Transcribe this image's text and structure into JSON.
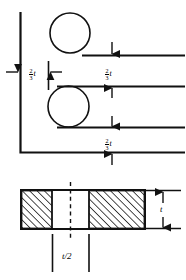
{
  "figure": {
    "stroke_color": "#1a1a1a",
    "background_color": "#ffffff"
  },
  "upper_view": {
    "name": "elevation-with-rivets",
    "edge_distance_label": {
      "numerator": "2",
      "denominator": "3",
      "symbol": "t"
    },
    "pitch_top_label": {
      "numerator": "2",
      "denominator": "3",
      "symbol": "t"
    },
    "pitch_bottom_label": {
      "numerator": "2",
      "denominator": "3",
      "symbol": "t"
    },
    "rivets": [
      {
        "name": "upper-rivet",
        "cx": 70,
        "cy": 33,
        "r": 20
      },
      {
        "name": "lower-rivet",
        "cx": 68.5,
        "cy": 106.5,
        "r": 20.5
      }
    ]
  },
  "lower_view": {
    "name": "plate-section",
    "thickness_label": "t",
    "half_thickness_label": "t/2",
    "hatched_blocks": [
      {
        "name": "left-plate-block",
        "x": 21,
        "width": 31
      },
      {
        "name": "right-plate-block",
        "x": 89,
        "width": 56
      }
    ]
  }
}
